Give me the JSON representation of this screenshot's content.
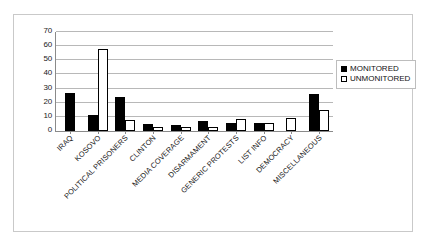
{
  "chart_data": {
    "type": "bar",
    "title": "",
    "xlabel": "",
    "ylabel": "",
    "ylim": [
      0,
      70
    ],
    "yticks": [
      0,
      10,
      20,
      30,
      40,
      50,
      60,
      70
    ],
    "grid": true,
    "legend_position": "right",
    "categories": [
      "IRAQ",
      "KOSOVO",
      "POLITICAL PRISONERS",
      "CLINTON",
      "MEDIA COVERAGE",
      "DISARMAMENT",
      "GENERIC PROTESTS",
      "LIST INFO",
      "DEMOCRACY",
      "MISCELLANEOUS"
    ],
    "series": [
      {
        "name": "MONITORED",
        "color": "#000000",
        "style": "filled",
        "values": [
          27,
          11,
          24,
          5,
          4,
          7,
          5.5,
          5.5,
          0,
          26
        ]
      },
      {
        "name": "UNMONITORED",
        "color": "#ffffff",
        "style": "outlined",
        "values": [
          0,
          58,
          8,
          3,
          3,
          2.5,
          8.5,
          6,
          9,
          15
        ]
      }
    ]
  },
  "legend": {
    "items": [
      {
        "label": "MONITORED",
        "swatch": "filled-square-icon"
      },
      {
        "label": "UNMONITORED",
        "swatch": "outlined-square-icon"
      }
    ]
  }
}
